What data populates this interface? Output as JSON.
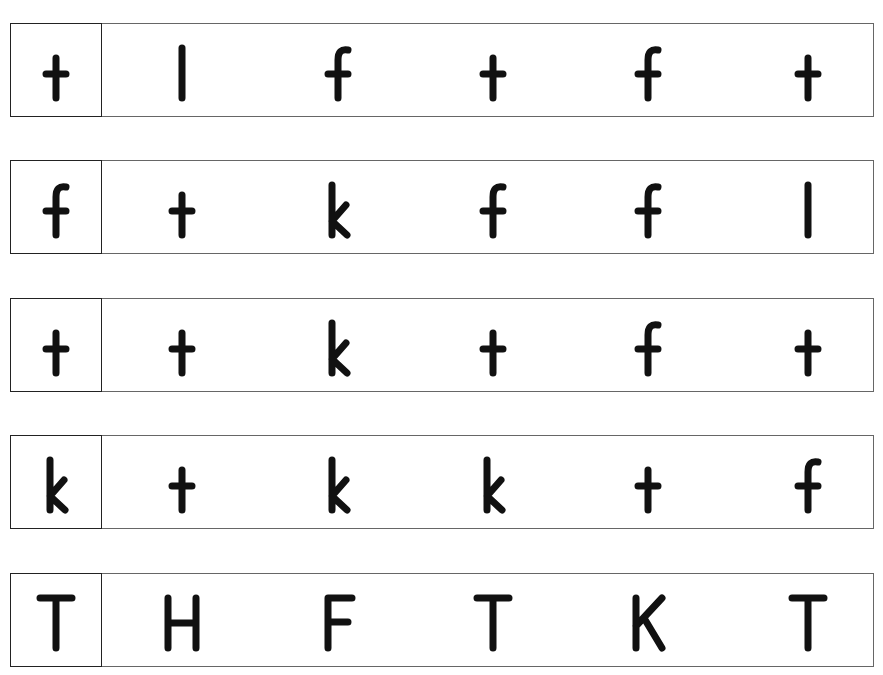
{
  "worksheet": {
    "rows": [
      {
        "target": "t",
        "choices": [
          "l",
          "f",
          "t",
          "f",
          "t"
        ]
      },
      {
        "target": "f",
        "choices": [
          "t",
          "k",
          "f",
          "f",
          "l"
        ]
      },
      {
        "target": "t",
        "choices": [
          "t",
          "k",
          "t",
          "f",
          "t"
        ]
      },
      {
        "target": "k",
        "choices": [
          "t",
          "k",
          "k",
          "t",
          "f"
        ]
      },
      {
        "target": "T",
        "choices": [
          "H",
          "F",
          "T",
          "K",
          "T"
        ]
      }
    ]
  },
  "layout": {
    "row_tops": [
      23,
      160,
      298,
      435,
      573
    ],
    "cell_centers": [
      45,
      171,
      327,
      482,
      637,
      797
    ]
  }
}
